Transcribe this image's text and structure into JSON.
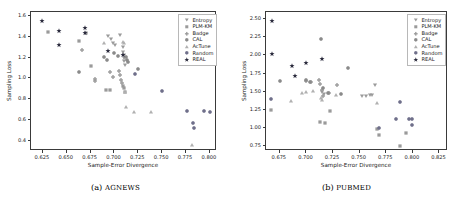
{
  "figure": {
    "panels": [
      {
        "key": "agnews",
        "caption_index": "(a)",
        "caption_name": "AGNEWS",
        "xlabel": "Sample-Error Divergence",
        "ylabel": "Sampling Loss",
        "xticks": [
          "0.625",
          "0.650",
          "0.675",
          "0.700",
          "0.725",
          "0.750",
          "0.775",
          "0.800"
        ],
        "yticks": [
          "0.4",
          "0.6",
          "0.8",
          "1.0",
          "1.2",
          "1.4",
          "1.6"
        ]
      },
      {
        "key": "pubmed",
        "caption_index": "(b)",
        "caption_name": "PUBMED",
        "xlabel": "Sample-Error Divergence",
        "ylabel": "Sampling Loss",
        "xticks": [
          "0.675",
          "0.700",
          "0.725",
          "0.750",
          "0.775",
          "0.800",
          "0.825"
        ],
        "yticks": [
          "0.75",
          "1.00",
          "1.25",
          "1.50",
          "1.75",
          "2.00",
          "2.25",
          "2.50"
        ]
      }
    ],
    "legend": [
      {
        "label": "Entropy",
        "marker": "triangle-down",
        "color": "#9a9a9a"
      },
      {
        "label": "PLM-KM",
        "marker": "square",
        "color": "#9a9a9a"
      },
      {
        "label": "Badge",
        "marker": "plus-filled",
        "color": "#9a9a9a"
      },
      {
        "label": "CAL",
        "marker": "hexagon",
        "color": "#8a8a8a"
      },
      {
        "label": "AcTune",
        "marker": "triangle-up",
        "color": "#b0b0b0"
      },
      {
        "label": "Random",
        "marker": "hexagon",
        "color": "#6f6f8a"
      },
      {
        "label": "REAL",
        "marker": "star",
        "color": "#2b2b3d"
      }
    ]
  },
  "chart_data": [
    {
      "type": "scatter",
      "title": "(a) AGNEWS",
      "xlabel": "Sample-Error Divergence",
      "ylabel": "Sampling Loss",
      "xlim": [
        0.6125,
        0.8075
      ],
      "ylim": [
        0.3,
        1.64
      ],
      "grid": false,
      "legend_position": "upper right",
      "series": [
        {
          "name": "Entropy",
          "marker": "triangle-down",
          "color": "#9a9a9a",
          "points": [
            [
              0.6935,
              1.405
            ],
            [
              0.696,
              1.375
            ],
            [
              0.6985,
              1.345
            ],
            [
              0.701,
              1.318
            ],
            [
              0.7055,
              1.42
            ],
            [
              0.7085,
              1.3
            ],
            [
              0.709,
              1.255
            ],
            [
              0.7095,
              1.228
            ],
            [
              0.71,
              1.2
            ],
            [
              0.7105,
              1.165
            ],
            [
              0.711,
              1.13
            ]
          ]
        },
        {
          "name": "PLM-KM",
          "marker": "square",
          "color": "#9a9a9a",
          "points": [
            [
              0.63,
              1.452
            ],
            [
              0.6625,
              1.36
            ],
            [
              0.67,
              1.44
            ],
            [
              0.6755,
              1.12
            ],
            [
              0.6915,
              0.888
            ],
            [
              0.695,
              0.885
            ],
            [
              0.709,
              0.93
            ],
            [
              0.7105,
              0.905
            ],
            [
              0.711,
              0.872
            ]
          ]
        },
        {
          "name": "Badge",
          "marker": "plus-filled",
          "color": "#9a9a9a",
          "points": [
            [
              0.6655,
              1.27
            ],
            [
              0.6795,
              0.995
            ],
            [
              0.68,
              0.975
            ],
            [
              0.6955,
              1.065
            ],
            [
              0.6985,
              1.015
            ],
            [
              0.705,
              1.075
            ],
            [
              0.706,
              1.03
            ],
            [
              0.7065,
              0.98
            ],
            [
              0.708,
              0.955
            ]
          ]
        },
        {
          "name": "CAL",
          "marker": "hexagon",
          "color": "#8a8a8a",
          "points": [
            [
              0.6625,
              1.06
            ],
            [
              0.6895,
              1.205
            ],
            [
              0.692,
              1.18
            ],
            [
              0.699,
              1.245
            ],
            [
              0.7035,
              1.215
            ],
            [
              0.712,
              1.205
            ],
            [
              0.7135,
              1.182
            ],
            [
              0.7145,
              1.16
            ],
            [
              0.7245,
              1.095
            ]
          ]
        },
        {
          "name": "AcTune",
          "marker": "triangle-up",
          "color": "#b0b0b0",
          "points": [
            [
              0.6895,
              1.345
            ],
            [
              0.7085,
              1.35
            ],
            [
              0.7105,
              1.34
            ],
            [
              0.711,
              0.865
            ],
            [
              0.712,
              0.72
            ],
            [
              0.72,
              0.675
            ],
            [
              0.738,
              0.672
            ],
            [
              0.781,
              0.355
            ]
          ]
        },
        {
          "name": "Random",
          "marker": "hexagon",
          "color": "#6f6f8a",
          "points": [
            [
              0.7215,
              1.04
            ],
            [
              0.75,
              0.875
            ],
            [
              0.7765,
              0.69
            ],
            [
              0.7825,
              0.57
            ],
            [
              0.783,
              0.522
            ],
            [
              0.794,
              0.69
            ],
            [
              0.8,
              0.672
            ]
          ]
        },
        {
          "name": "REAL",
          "marker": "star",
          "color": "#2b2b3d",
          "points": [
            [
              0.6245,
              1.552
            ],
            [
              0.6415,
              1.458
            ],
            [
              0.642,
              1.318
            ],
            [
              0.669,
              1.488
            ],
            [
              0.6695,
              1.442
            ],
            [
              0.6935,
              1.262
            ],
            [
              0.709,
              1.228
            ]
          ]
        }
      ]
    },
    {
      "type": "scatter",
      "title": "(b) PUBMED",
      "xlabel": "Sample-Error Divergence",
      "ylabel": "Sampling Loss",
      "xlim": [
        0.662,
        0.833
      ],
      "ylim": [
        0.68,
        2.6
      ],
      "grid": false,
      "legend_position": "upper right",
      "series": [
        {
          "name": "Entropy",
          "marker": "triangle-down",
          "color": "#9a9a9a",
          "points": [
            [
              0.715,
              1.49
            ],
            [
              0.7165,
              1.47
            ],
            [
              0.752,
              1.44
            ],
            [
              0.7555,
              1.438
            ],
            [
              0.76,
              1.45
            ],
            [
              0.762,
              1.448
            ],
            [
              0.7645,
              1.598
            ]
          ]
        },
        {
          "name": "PLM-KM",
          "marker": "square",
          "color": "#9a9a9a",
          "points": [
            [
              0.6665,
              1.248
            ],
            [
              0.7125,
              1.075
            ],
            [
              0.717,
              1.07
            ],
            [
              0.7225,
              1.23
            ],
            [
              0.766,
              0.985
            ],
            [
              0.768,
              0.895
            ],
            [
              0.7875,
              0.755
            ],
            [
              0.794,
              0.93
            ]
          ]
        },
        {
          "name": "Badge",
          "marker": "plus-filled",
          "color": "#9a9a9a",
          "points": [
            [
              0.6995,
              1.65
            ],
            [
              0.7045,
              1.64
            ],
            [
              0.712,
              1.66
            ],
            [
              0.713,
              1.61
            ],
            [
              0.715,
              1.52
            ],
            [
              0.7155,
              1.44
            ],
            [
              0.7215,
              1.48
            ],
            [
              0.729,
              1.585
            ]
          ]
        },
        {
          "name": "CAL",
          "marker": "hexagon",
          "color": "#8a8a8a",
          "points": [
            [
              0.6755,
              1.65
            ],
            [
              0.7,
              1.665
            ],
            [
              0.7035,
              1.64
            ],
            [
              0.714,
              2.23
            ],
            [
              0.716,
              1.545
            ],
            [
              0.72,
              1.478
            ],
            [
              0.732,
              1.47
            ],
            [
              0.7395,
              1.83
            ]
          ]
        },
        {
          "name": "AcTune",
          "marker": "triangle-up",
          "color": "#b0b0b0",
          "points": [
            [
              0.6855,
              1.37
            ],
            [
              0.696,
              1.48
            ],
            [
              0.7,
              1.5
            ],
            [
              0.7065,
              1.51
            ],
            [
              0.7135,
              1.415
            ],
            [
              0.7145,
              1.385
            ],
            [
              0.728,
              1.45
            ],
            [
              0.7665,
              1.345
            ]
          ]
        },
        {
          "name": "Random",
          "marker": "hexagon",
          "color": "#6f6f8a",
          "points": [
            [
              0.667,
              1.405
            ],
            [
              0.768,
              1.002
            ],
            [
              0.784,
              1.12
            ],
            [
              0.7875,
              1.36
            ],
            [
              0.7965,
              1.118
            ],
            [
              0.799,
              1.12
            ],
            [
              0.7995,
              1.035
            ]
          ]
        },
        {
          "name": "REAL",
          "marker": "star",
          "color": "#2b2b3d",
          "points": [
            [
              0.668,
              2.48
            ],
            [
              0.668,
              2.015
            ],
            [
              0.686,
              1.86
            ],
            [
              0.689,
              1.715
            ],
            [
              0.6995,
              1.895
            ],
            [
              0.7145,
              1.945
            ]
          ]
        }
      ]
    }
  ]
}
